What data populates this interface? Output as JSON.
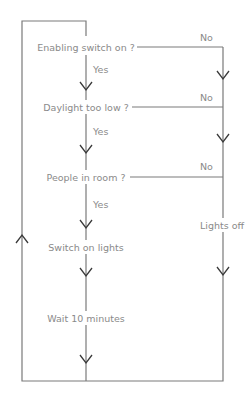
{
  "diagram": {
    "type": "flowchart",
    "steps": {
      "decision_1": "Enabling switch on ?",
      "decision_2": "Daylight too low ?",
      "decision_3": "People in room ?",
      "action_1": "Switch on lights",
      "action_2": "Wait 10 minutes",
      "action_off": "Lights off"
    },
    "labels": {
      "yes_1": "Yes",
      "yes_2": "Yes",
      "yes_3": "Yes",
      "no_1": "No",
      "no_2": "No",
      "no_3": "No"
    },
    "colors": {
      "line": "#7a7a7a",
      "arrow": "#3a3a3a",
      "text": "#8a8a8a"
    }
  }
}
